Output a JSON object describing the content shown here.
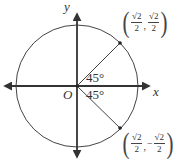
{
  "diagram": {
    "type": "unit-circle",
    "axes": {
      "x_label": "x",
      "y_label": "y",
      "origin_label": "O"
    },
    "angles": [
      {
        "label": "45°",
        "position": "above-x-axis"
      },
      {
        "label": "45°",
        "position": "below-x-axis"
      }
    ],
    "points": [
      {
        "name": "upper-point",
        "x_num": "√2",
        "x_den": "2",
        "y_sign": "",
        "y_num": "√2",
        "y_den": "2"
      },
      {
        "name": "lower-point",
        "x_num": "√2",
        "x_den": "2",
        "y_sign": "−",
        "y_num": "√2",
        "y_den": "2"
      }
    ],
    "colors": {
      "stroke": "#333333",
      "text": "#333333",
      "background": "#ffffff"
    }
  }
}
